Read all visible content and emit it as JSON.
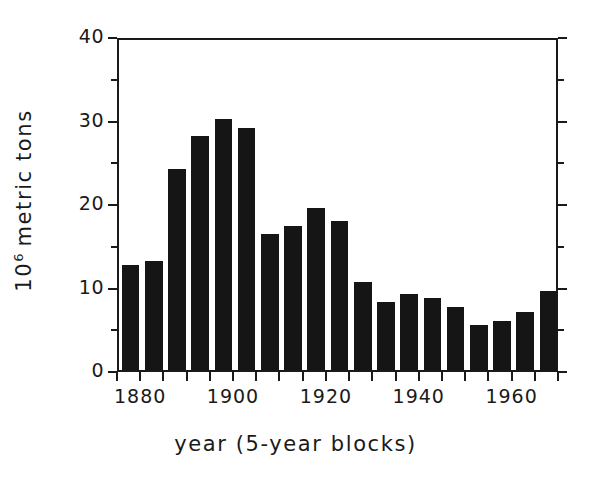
{
  "chart_data": {
    "type": "bar",
    "title": "",
    "subtitle": "",
    "xlabel": "year (5-year blocks)",
    "ylabel": "10^6 metric tons",
    "ylabel_mantissa": "10",
    "ylabel_exponent": "6",
    "ylabel_rest": "metric tons",
    "xlim": [
      1875,
      1970
    ],
    "ylim": [
      0,
      40
    ],
    "grid": false,
    "legend": "none",
    "bar_color": "#151515",
    "axis_color": "#1a1a1a",
    "background_color": "#ffffff",
    "y_ticks_major": [
      0,
      10,
      20,
      30,
      40
    ],
    "y_tick_labels": [
      "0",
      "10",
      "20",
      "30",
      "40"
    ],
    "y_ticks_minor": [
      5,
      15,
      25,
      35
    ],
    "x_ticks_major": [
      1880,
      1900,
      1920,
      1940,
      1960
    ],
    "x_tick_labels": [
      "1880",
      "1900",
      "1920",
      "1940",
      "1960"
    ],
    "x_ticks_minor": [
      1875,
      1885,
      1890,
      1895,
      1905,
      1910,
      1915,
      1925,
      1930,
      1935,
      1945,
      1950,
      1955,
      1965,
      1970
    ],
    "x_tick_step_years": 5,
    "categories": [
      "1875",
      "1880",
      "1885",
      "1890",
      "1895",
      "1900",
      "1905",
      "1910",
      "1915",
      "1920",
      "1925",
      "1930",
      "1935",
      "1940",
      "1945",
      "1950",
      "1955",
      "1960",
      "1965"
    ],
    "values": [
      12.6,
      13.0,
      24.1,
      28.0,
      30.1,
      29.0,
      16.3,
      17.3,
      19.4,
      17.8,
      10.6,
      8.1,
      9.1,
      8.6,
      7.5,
      5.4,
      5.9,
      7.0,
      9.5
    ]
  },
  "axis_titles": {
    "x": "year (5-year blocks)"
  }
}
